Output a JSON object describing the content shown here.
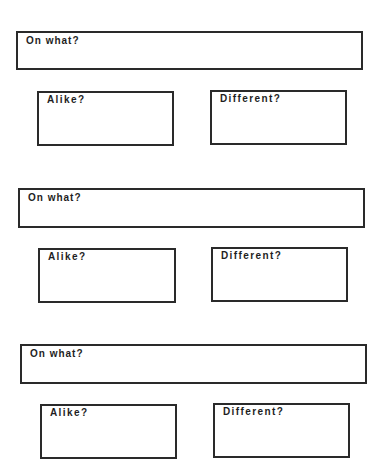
{
  "worksheet": {
    "groups": [
      {
        "topic_label": "On what?",
        "alike_label": "Alike?",
        "different_label": "Different?"
      },
      {
        "topic_label": "On what?",
        "alike_label": "Alike?",
        "different_label": "Different?"
      },
      {
        "topic_label": "On what?",
        "alike_label": "Alike?",
        "different_label": "Different?"
      }
    ]
  },
  "colors": {
    "border": "#2a2a2a",
    "text": "#1e1e1e",
    "background": "#ffffff"
  }
}
